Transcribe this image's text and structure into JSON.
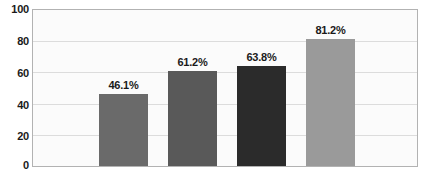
{
  "chart_data": {
    "type": "bar",
    "title": "",
    "subtitle": "",
    "xlabel": "",
    "ylabel": "",
    "categories": [
      "",
      "",
      "",
      ""
    ],
    "values": [
      46.1,
      61.2,
      63.8,
      81.2
    ],
    "data_labels": [
      "46.1%",
      "61.2%",
      "63.8%",
      "81.2%"
    ],
    "bar_colors": [
      "#6a6a6a",
      "#595959",
      "#2b2b2b",
      "#9a9a9a"
    ],
    "ylim": [
      0,
      100
    ],
    "yticks": [
      0,
      20,
      40,
      60,
      80,
      100
    ],
    "ytick_labels": [
      "0",
      "20",
      "40",
      "60",
      "80",
      "100"
    ],
    "gridlines": [
      20,
      40,
      60,
      80
    ],
    "grid": true,
    "legend": "none",
    "plot_background": "#fbfbfb",
    "plot_border_color": "#b2b2b2",
    "gridline_color": "#dcdcdc",
    "label_color": "#1a1a1a"
  }
}
